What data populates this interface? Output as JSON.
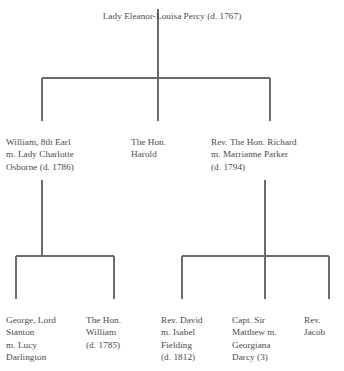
{
  "diagram": {
    "type": "family-tree",
    "title": "Lady Eleanor-Louisa Percy (d. 1767)",
    "line_color": "#6b6b6b",
    "text_color": "#4a4a4a",
    "background": "#ffffff"
  },
  "root": {
    "name": "Lady Eleanor-Louisa Percy (d. 1767)"
  },
  "generation2": [
    {
      "id": "william-8th-earl",
      "name": "William, 8th Earl\nm. Lady Charlotte\nOsborne (d. 1786)"
    },
    {
      "id": "hon-harold",
      "name": "The Hon.\nHarold"
    },
    {
      "id": "rev-hon-richard",
      "name": "Rev. The Hon. Richard\nm. Marrianne Parker\n(d. 1794)"
    }
  ],
  "generation3": [
    {
      "id": "george-lord-stanton",
      "name": "George, Lord\nStanton\nm. Lucy\nDarlington"
    },
    {
      "id": "hon-william",
      "name": "The Hon.\nWilliam\n(d. 1785)"
    },
    {
      "id": "rev-david",
      "name": "Rev. David\nm. Isabel\nFielding\n(d. 1812)"
    },
    {
      "id": "capt-sir-matthew",
      "name": "Capt. Sir\nMatthew m.\nGeorgiana\nDarcy (3)"
    },
    {
      "id": "rev-jacob",
      "name": "Rev.\nJacob"
    }
  ]
}
